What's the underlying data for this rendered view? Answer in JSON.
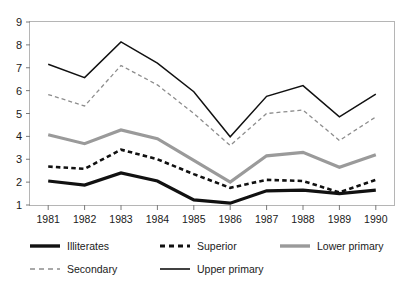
{
  "chart_data": {
    "type": "line",
    "title": "",
    "subtitle": "",
    "xlabel": "",
    "ylabel": "",
    "x": [
      1981,
      1982,
      1983,
      1984,
      1985,
      1986,
      1987,
      1988,
      1989,
      1990
    ],
    "xtick_labels": [
      "1981",
      "1982",
      "1983",
      "1984",
      "1985",
      "1986",
      "1987",
      "1988",
      "1989",
      "1990"
    ],
    "ytick_labels": [
      "1",
      "2",
      "3",
      "4",
      "5",
      "6",
      "7",
      "8",
      "9"
    ],
    "yticks": [
      1,
      2,
      3,
      4,
      5,
      6,
      7,
      8,
      9
    ],
    "ylim": [
      1,
      9
    ],
    "xlim": [
      1981,
      1990
    ],
    "grid": false,
    "legend_position": "bottom",
    "series": [
      {
        "name": "Illiterates",
        "values": [
          2.05,
          1.87,
          2.4,
          2.05,
          1.22,
          1.08,
          1.62,
          1.65,
          1.5,
          1.65
        ],
        "color": "#111111",
        "style": "solid",
        "width": 3.2
      },
      {
        "name": "Superior",
        "values": [
          2.68,
          2.58,
          3.42,
          3.0,
          2.35,
          1.75,
          2.1,
          2.05,
          1.55,
          2.1
        ],
        "color": "#111111",
        "style": "dashed",
        "width": 2.6
      },
      {
        "name": "Lower primary",
        "values": [
          4.07,
          3.68,
          4.28,
          3.9,
          2.95,
          2.0,
          3.15,
          3.3,
          2.65,
          3.2
        ],
        "color": "#9a9a9a",
        "style": "solid",
        "width": 3.2
      },
      {
        "name": "Secondary",
        "values": [
          5.83,
          5.33,
          7.1,
          6.25,
          5.0,
          3.6,
          5.0,
          5.15,
          3.82,
          4.85
        ],
        "color": "#8d8d8d",
        "style": "dashed",
        "width": 1.3
      },
      {
        "name": "Upper primary",
        "values": [
          7.15,
          6.57,
          8.13,
          7.2,
          5.95,
          3.98,
          5.75,
          6.22,
          4.85,
          5.85
        ],
        "color": "#111111",
        "style": "solid",
        "width": 1.5
      }
    ]
  },
  "legend": {
    "items": [
      {
        "label": "Illiterates",
        "series": 0
      },
      {
        "label": "Superior",
        "series": 1
      },
      {
        "label": "Lower primary",
        "series": 2
      },
      {
        "label": "Secondary",
        "series": 3
      },
      {
        "label": "Upper primary",
        "series": 4
      }
    ]
  },
  "axes": {
    "border_color": "#b5b5b5",
    "tick_color": "#7a7a7a"
  }
}
